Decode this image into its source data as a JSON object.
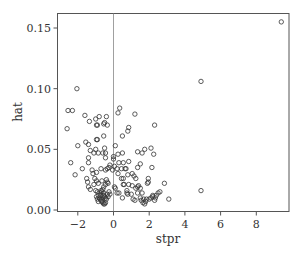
{
  "chart_data": {
    "type": "scatter",
    "title": "",
    "xlabel": "stpr",
    "ylabel": "hat",
    "xlim": [
      -3.1,
      10.0
    ],
    "ylim": [
      -0.002,
      0.163
    ],
    "x_ticks": [
      -2,
      0,
      2,
      4,
      6,
      8
    ],
    "x_tick_labels": [
      "−2",
      "0",
      "2",
      "4",
      "6",
      "8"
    ],
    "y_ticks": [
      0.0,
      0.05,
      0.1,
      0.15
    ],
    "y_tick_labels": [
      "0.00",
      "0.05",
      "0.10",
      "0.15"
    ],
    "grid": false,
    "reference_line": {
      "orientation": "vertical",
      "x": 0,
      "color": "#888888"
    },
    "marker": {
      "shape": "circle-open",
      "radius": 2.2,
      "stroke": "#333333"
    },
    "legend": null,
    "points": [
      [
        9.4,
        0.155
      ],
      [
        4.9,
        0.106
      ],
      [
        4.9,
        0.016
      ],
      [
        -2.05,
        0.1
      ],
      [
        -2.55,
        0.082
      ],
      [
        -2.3,
        0.082
      ],
      [
        -2.6,
        0.067
      ],
      [
        -1.6,
        0.078
      ],
      [
        -1.35,
        0.073
      ],
      [
        -1.0,
        0.075
      ],
      [
        -0.8,
        0.077
      ],
      [
        -0.9,
        0.07
      ],
      [
        -0.95,
        0.07
      ],
      [
        -0.55,
        0.071
      ],
      [
        -0.5,
        0.072
      ],
      [
        -0.4,
        0.077
      ],
      [
        -0.35,
        0.07
      ],
      [
        0.25,
        0.08
      ],
      [
        0.35,
        0.084
      ],
      [
        1.2,
        0.079
      ],
      [
        2.3,
        0.07
      ],
      [
        0.85,
        0.068
      ],
      [
        0.8,
        0.065
      ],
      [
        0.5,
        0.061
      ],
      [
        -0.55,
        0.061
      ],
      [
        -0.95,
        0.058
      ],
      [
        -0.9,
        0.058
      ],
      [
        -1.55,
        0.056
      ],
      [
        -1.4,
        0.054
      ],
      [
        -2.0,
        0.053
      ],
      [
        0.1,
        0.053
      ],
      [
        -0.5,
        0.051
      ],
      [
        -1.0,
        0.05
      ],
      [
        -1.3,
        0.049
      ],
      [
        -1.1,
        0.047
      ],
      [
        -0.85,
        0.047
      ],
      [
        -0.6,
        0.047
      ],
      [
        -0.45,
        0.047
      ],
      [
        0.25,
        0.046
      ],
      [
        0.5,
        0.047
      ],
      [
        1.35,
        0.048
      ],
      [
        1.6,
        0.047
      ],
      [
        1.75,
        0.05
      ],
      [
        2.1,
        0.051
      ],
      [
        2.25,
        0.046
      ],
      [
        -1.4,
        0.043
      ],
      [
        -0.45,
        0.043
      ],
      [
        0.0,
        0.044
      ],
      [
        0.0,
        0.042
      ],
      [
        -2.4,
        0.039
      ],
      [
        -1.4,
        0.039
      ],
      [
        0.3,
        0.039
      ],
      [
        0.55,
        0.039
      ],
      [
        0.85,
        0.04
      ],
      [
        1.5,
        0.038
      ],
      [
        -0.2,
        0.037
      ],
      [
        -0.25,
        0.035
      ],
      [
        -0.35,
        0.034
      ],
      [
        -0.7,
        0.034
      ],
      [
        0.05,
        0.036
      ],
      [
        0.2,
        0.034
      ],
      [
        0.45,
        0.034
      ],
      [
        0.65,
        0.034
      ],
      [
        0.7,
        0.034
      ],
      [
        1.35,
        0.035
      ],
      [
        2.15,
        0.035
      ],
      [
        -1.75,
        0.034
      ],
      [
        -1.2,
        0.033
      ],
      [
        -1.15,
        0.03
      ],
      [
        -0.95,
        0.031
      ],
      [
        -0.45,
        0.033
      ],
      [
        -0.05,
        0.033
      ],
      [
        0.25,
        0.03
      ],
      [
        0.8,
        0.029
      ],
      [
        1.05,
        0.03
      ],
      [
        1.15,
        0.028
      ],
      [
        -2.15,
        0.029
      ],
      [
        -1.5,
        0.026
      ],
      [
        -1.05,
        0.026
      ],
      [
        -0.95,
        0.024
      ],
      [
        -0.85,
        0.022
      ],
      [
        -0.65,
        0.024
      ],
      [
        -0.4,
        0.025
      ],
      [
        -0.35,
        0.023
      ],
      [
        -0.45,
        0.021
      ],
      [
        -0.3,
        0.022
      ],
      [
        0.45,
        0.026
      ],
      [
        0.55,
        0.026
      ],
      [
        1.25,
        0.026
      ],
      [
        1.95,
        0.026
      ],
      [
        -1.45,
        0.023
      ],
      [
        -1.4,
        0.019
      ],
      [
        -1.1,
        0.021
      ],
      [
        -0.55,
        0.019
      ],
      [
        -0.6,
        0.017
      ],
      [
        0.05,
        0.019
      ],
      [
        0.1,
        0.018
      ],
      [
        0.55,
        0.021
      ],
      [
        0.6,
        0.021
      ],
      [
        0.85,
        0.021
      ],
      [
        1.05,
        0.02
      ],
      [
        1.4,
        0.02
      ],
      [
        1.5,
        0.018
      ],
      [
        1.9,
        0.022
      ],
      [
        1.95,
        0.023
      ],
      [
        2.85,
        0.022
      ],
      [
        -1.3,
        0.017
      ],
      [
        -1.0,
        0.016
      ],
      [
        -0.9,
        0.015
      ],
      [
        -0.75,
        0.014
      ],
      [
        -0.7,
        0.012
      ],
      [
        -0.85,
        0.012
      ],
      [
        -0.8,
        0.01
      ],
      [
        -0.75,
        0.009
      ],
      [
        -0.7,
        0.008
      ],
      [
        -0.65,
        0.007
      ],
      [
        -0.6,
        0.006
      ],
      [
        -0.55,
        0.005
      ],
      [
        -0.5,
        0.005
      ],
      [
        -0.45,
        0.006
      ],
      [
        -0.95,
        0.011
      ],
      [
        -0.9,
        0.009
      ],
      [
        -0.85,
        0.007
      ],
      [
        -0.6,
        0.01
      ],
      [
        -0.55,
        0.012
      ],
      [
        -0.5,
        0.011
      ],
      [
        -0.45,
        0.01
      ],
      [
        -0.4,
        0.009
      ],
      [
        -0.35,
        0.013
      ],
      [
        -0.3,
        0.011
      ],
      [
        -0.25,
        0.015
      ],
      [
        -0.2,
        0.013
      ],
      [
        -0.65,
        0.015
      ],
      [
        -0.7,
        0.016
      ],
      [
        -0.55,
        0.014
      ],
      [
        0.2,
        0.014
      ],
      [
        0.3,
        0.014
      ],
      [
        0.5,
        0.01
      ],
      [
        0.75,
        0.016
      ],
      [
        0.75,
        0.014
      ],
      [
        0.8,
        0.013
      ],
      [
        1.0,
        0.013
      ],
      [
        1.1,
        0.009
      ],
      [
        1.2,
        0.008
      ],
      [
        1.35,
        0.014
      ],
      [
        1.5,
        0.01
      ],
      [
        1.55,
        0.008
      ],
      [
        1.65,
        0.006
      ],
      [
        1.7,
        0.009
      ],
      [
        1.75,
        0.005
      ],
      [
        1.8,
        0.007
      ],
      [
        1.85,
        0.009
      ],
      [
        2.0,
        0.009
      ],
      [
        2.1,
        0.01
      ],
      [
        2.2,
        0.011
      ],
      [
        2.3,
        0.008
      ],
      [
        2.4,
        0.012
      ],
      [
        2.5,
        0.014
      ],
      [
        2.6,
        0.015
      ],
      [
        3.1,
        0.009
      ],
      [
        1.25,
        0.018
      ],
      [
        1.35,
        0.019
      ],
      [
        1.6,
        0.014
      ],
      [
        2.2,
        0.012
      ],
      [
        2.35,
        0.01
      ]
    ]
  },
  "axes": {
    "x_label": "stpr",
    "y_label": "hat"
  }
}
